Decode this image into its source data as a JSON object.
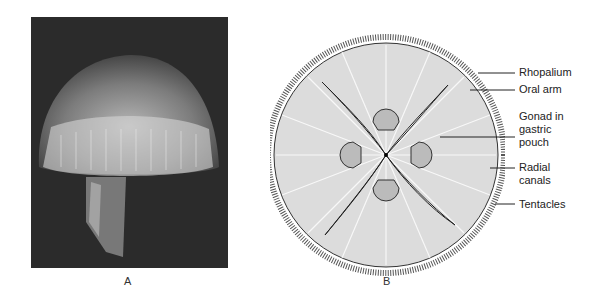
{
  "figure": {
    "panel_a": {
      "caption": "A",
      "description": "Photograph of a jellyfish (moon jelly) against dark background"
    },
    "panel_b": {
      "caption": "B",
      "description": "Oral view diagram of jellyfish",
      "labels": [
        {
          "text": "Rhopalium"
        },
        {
          "text": "Oral arm"
        },
        {
          "text": "Gonad in gastric pouch"
        },
        {
          "text": "Radial canals"
        },
        {
          "text": "Tentacles"
        }
      ]
    }
  },
  "colors": {
    "photo_bg": "#2b2b2b",
    "line": "#222222",
    "fill": "#d8d8d8"
  }
}
